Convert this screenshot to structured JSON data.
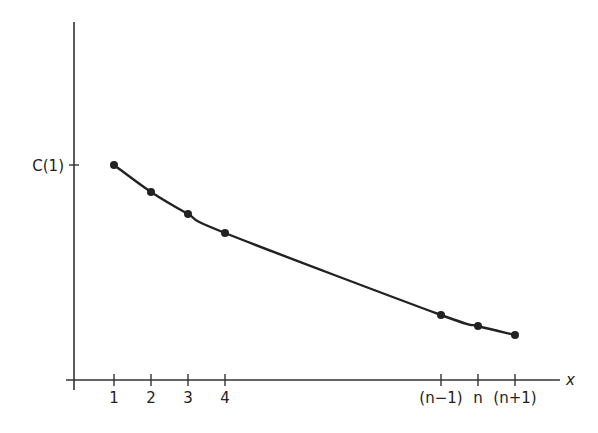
{
  "chart_data": {
    "type": "line",
    "title": "",
    "xlabel": "x",
    "ylabel": "",
    "y_tick_labels": [
      "C(1)"
    ],
    "x_tick_labels": [
      "1",
      "2",
      "3",
      "4",
      "(n−1)",
      "n",
      "(n+1)"
    ],
    "series": [
      {
        "name": "C(x)",
        "points": [
          {
            "x": "1",
            "px": 114,
            "py": 165,
            "relative_value": 1.0
          },
          {
            "x": "2",
            "px": 151,
            "py": 192,
            "relative_value": 0.88
          },
          {
            "x": "3",
            "px": 188,
            "py": 214,
            "relative_value": 0.77
          },
          {
            "x": "4",
            "px": 225,
            "py": 233,
            "relative_value": 0.68
          },
          {
            "x": "(n−1)",
            "px": 441,
            "py": 315,
            "relative_value": 0.3
          },
          {
            "x": "n",
            "px": 478,
            "py": 326,
            "relative_value": 0.25
          },
          {
            "x": "(n+1)",
            "px": 515,
            "py": 335,
            "relative_value": 0.21
          }
        ]
      }
    ],
    "grid": false,
    "legend": null
  },
  "labels": {
    "y_tick": "C(1)",
    "x_axis": "x",
    "ticks": [
      "1",
      "2",
      "3",
      "4",
      "(n−1)",
      "n",
      "(n+1)"
    ]
  },
  "colors": {
    "ink": "#222222",
    "background": "#ffffff"
  }
}
